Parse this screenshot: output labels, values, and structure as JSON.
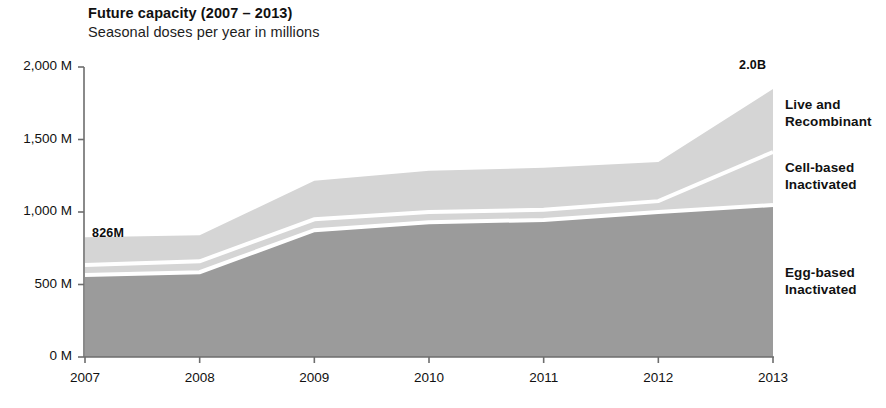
{
  "header": {
    "title": "Future capacity (2007 – 2013)",
    "subtitle": "Seasonal doses per year in millions"
  },
  "annotations": {
    "start_total": "826M",
    "end_total": "2.0B"
  },
  "series_labels": {
    "live_recombinant_line1": "Live and",
    "live_recombinant_line2": "Recombinant",
    "cell_based_line1": "Cell-based",
    "cell_based_line2": "Inactivated",
    "egg_based_line1": "Egg-based",
    "egg_based_line2": "Inactivated"
  },
  "colors": {
    "live_recombinant": "#d5d5d5",
    "cell_based": "#d5d5d5",
    "egg_based": "#9b9b9b",
    "separator": "#ffffff",
    "axis": "#6d6d6d",
    "text": "#111111",
    "background": "#ffffff"
  },
  "chart_data": {
    "type": "area",
    "stacked": true,
    "title": "Future capacity (2007 – 2013)",
    "subtitle": "Seasonal doses per year in millions",
    "xlabel": "",
    "ylabel": "Seasonal doses per year in millions",
    "x": [
      2007,
      2008,
      2009,
      2010,
      2011,
      2012,
      2013
    ],
    "xticklabels": [
      "2007",
      "2008",
      "2009",
      "2010",
      "2011",
      "2012",
      "2013"
    ],
    "xlim": [
      2007,
      2013
    ],
    "ylim": [
      0,
      2000
    ],
    "yticks": [
      0,
      500,
      1000,
      1500,
      2000
    ],
    "yticklabels": [
      "0 M",
      "500 M",
      "1,000 M",
      "1,500 M",
      "2,000 M"
    ],
    "y_unit": "millions of doses",
    "grid": false,
    "legend": "right-of-plot inline labels",
    "series": [
      {
        "name": "Egg-based Inactivated",
        "color": "#9b9b9b",
        "values": [
          565,
          585,
          875,
          930,
          945,
          1000,
          1048
        ]
      },
      {
        "name": "Cell-based Inactivated",
        "color": "#d5d5d5",
        "values": [
          70,
          75,
          75,
          70,
          70,
          75,
          366
        ]
      },
      {
        "name": "Live and Recombinant",
        "color": "#d5d5d5",
        "values": [
          191,
          180,
          265,
          285,
          290,
          270,
          434
        ]
      }
    ],
    "cumulative_totals": [
      826,
      840,
      1215,
      1285,
      1305,
      1345,
      1848
    ],
    "annotations": [
      {
        "text": "826M",
        "x": 2007,
        "y": 826,
        "position": "above-left"
      },
      {
        "text": "2.0B",
        "x": 2013,
        "y": 1848,
        "position": "above-right"
      }
    ]
  }
}
